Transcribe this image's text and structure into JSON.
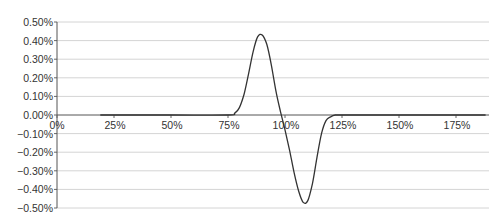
{
  "chart_data": {
    "type": "line",
    "title": "",
    "xlabel": "",
    "ylabel": "",
    "xlim": [
      0,
      1.9
    ],
    "ylim": [
      -0.005,
      0.005
    ],
    "grid": true,
    "legend": null,
    "x_ticks": [
      {
        "value": 0.0,
        "label": "0%"
      },
      {
        "value": 0.25,
        "label": "25%"
      },
      {
        "value": 0.5,
        "label": "50%"
      },
      {
        "value": 0.75,
        "label": "75%"
      },
      {
        "value": 1.0,
        "label": "100%"
      },
      {
        "value": 1.25,
        "label": "125%"
      },
      {
        "value": 1.5,
        "label": "150%"
      },
      {
        "value": 1.75,
        "label": "175%"
      }
    ],
    "y_ticks": [
      {
        "value": 0.005,
        "label": "0.50%"
      },
      {
        "value": 0.004,
        "label": "0.40%"
      },
      {
        "value": 0.003,
        "label": "0.30%"
      },
      {
        "value": 0.002,
        "label": "0.20%"
      },
      {
        "value": 0.001,
        "label": "0.10%"
      },
      {
        "value": 0.0,
        "label": "0.00%"
      },
      {
        "value": -0.001,
        "label": "-0.10%"
      },
      {
        "value": -0.002,
        "label": "-0.20%"
      },
      {
        "value": -0.003,
        "label": "-0.30%"
      },
      {
        "value": -0.004,
        "label": "-0.40%"
      },
      {
        "value": -0.005,
        "label": "-0.50%"
      }
    ],
    "series": [
      {
        "name": "series-1",
        "color": "#333333",
        "x": [
          0.19,
          0.5,
          0.75,
          0.78,
          0.8,
          0.82,
          0.84,
          0.86,
          0.88,
          0.9,
          0.92,
          0.94,
          0.96,
          0.98,
          1.0,
          1.02,
          1.04,
          1.06,
          1.08,
          1.1,
          1.12,
          1.14,
          1.16,
          1.18,
          1.2,
          1.22,
          1.25,
          1.5,
          1.75,
          1.88
        ],
        "y": [
          0.0,
          0.0,
          0.0,
          0.0001,
          0.0004,
          0.0011,
          0.0022,
          0.0034,
          0.0042,
          0.0043,
          0.0038,
          0.0027,
          0.0013,
          0.0002,
          -0.0008,
          -0.0019,
          -0.0031,
          -0.0041,
          -0.0047,
          -0.0046,
          -0.0037,
          -0.0023,
          -0.001,
          -0.0003,
          -0.0001,
          0.0,
          0.0,
          0.0,
          0.0,
          0.0
        ]
      }
    ]
  }
}
